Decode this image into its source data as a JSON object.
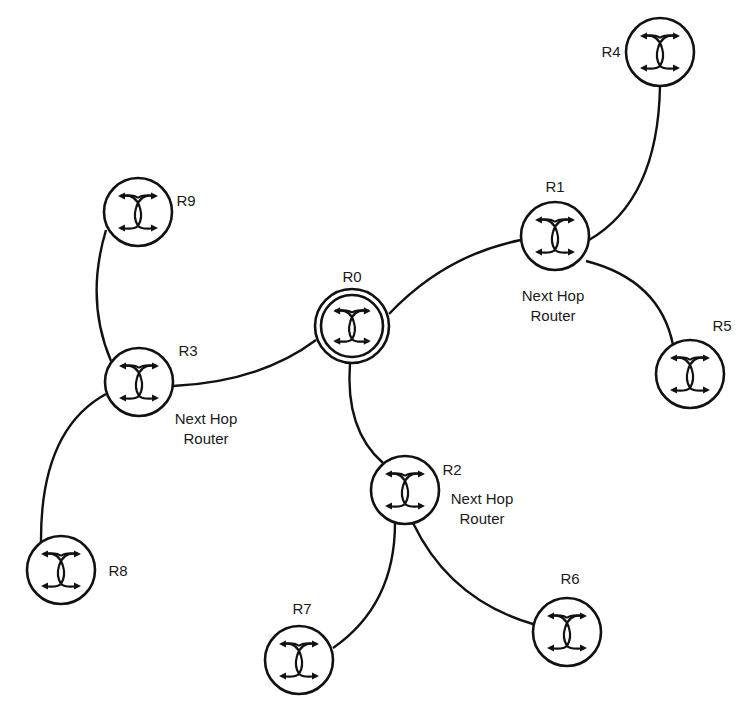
{
  "diagram": {
    "type": "network-topology",
    "line_color": "#111111",
    "background": "#ffffff",
    "nodes": [
      {
        "id": "R0",
        "label": "R0",
        "x": 352,
        "y": 326,
        "r": 37,
        "double_ring": true,
        "label_x": 352,
        "label_y": 282,
        "anchor": "middle"
      },
      {
        "id": "R1",
        "label": "R1",
        "x": 555,
        "y": 236,
        "r": 34,
        "label_x": 555,
        "label_y": 192,
        "anchor": "middle",
        "caption": [
          "Next Hop",
          "Router"
        ],
        "caption_x": 553,
        "caption_y": 301
      },
      {
        "id": "R2",
        "label": "R2",
        "x": 405,
        "y": 490,
        "r": 34,
        "label_x": 452,
        "label_y": 475,
        "anchor": "middle",
        "caption": [
          "Next Hop",
          "Router"
        ],
        "caption_x": 482,
        "caption_y": 504
      },
      {
        "id": "R3",
        "label": "R3",
        "x": 139,
        "y": 382,
        "r": 34,
        "label_x": 188,
        "label_y": 356,
        "anchor": "middle",
        "caption": [
          "Next Hop",
          "Router"
        ],
        "caption_x": 206,
        "caption_y": 424
      },
      {
        "id": "R4",
        "label": "R4",
        "x": 660,
        "y": 52,
        "r": 34,
        "label_x": 611,
        "label_y": 57,
        "anchor": "middle"
      },
      {
        "id": "R5",
        "label": "R5",
        "x": 690,
        "y": 374,
        "r": 34,
        "label_x": 722,
        "label_y": 331,
        "anchor": "middle"
      },
      {
        "id": "R6",
        "label": "R6",
        "x": 567,
        "y": 632,
        "r": 34,
        "label_x": 570,
        "label_y": 584,
        "anchor": "middle"
      },
      {
        "id": "R7",
        "label": "R7",
        "x": 299,
        "y": 660,
        "r": 34,
        "label_x": 302,
        "label_y": 614,
        "anchor": "middle"
      },
      {
        "id": "R8",
        "label": "R8",
        "x": 61,
        "y": 570,
        "r": 34,
        "label_x": 118,
        "label_y": 576,
        "anchor": "middle"
      },
      {
        "id": "R9",
        "label": "R9",
        "x": 138,
        "y": 212,
        "r": 34,
        "label_x": 186,
        "label_y": 206,
        "anchor": "middle"
      }
    ],
    "links": [
      {
        "from": "R0",
        "to": "R1",
        "path": "M 389 314 Q 445 255 521 240"
      },
      {
        "from": "R1",
        "to": "R4",
        "path": "M 589 240 Q 658 200 660 86"
      },
      {
        "from": "R1",
        "to": "R5",
        "path": "M 586 261 Q 660 280 673 345"
      },
      {
        "from": "R0",
        "to": "R3",
        "path": "M 316 340 Q 260 382 173 386"
      },
      {
        "from": "R3",
        "to": "R9",
        "path": "M 111 361 Q 85 300 106 230"
      },
      {
        "from": "R3",
        "to": "R8",
        "path": "M 106 394 Q 40 430 41 543"
      },
      {
        "from": "R0",
        "to": "R2",
        "path": "M 350 363 Q 345 430 383 463"
      },
      {
        "from": "R2",
        "to": "R7",
        "path": "M 395 523 Q 395 605 333 648"
      },
      {
        "from": "R2",
        "to": "R6",
        "path": "M 413 523 Q 450 600 533 624"
      }
    ]
  }
}
